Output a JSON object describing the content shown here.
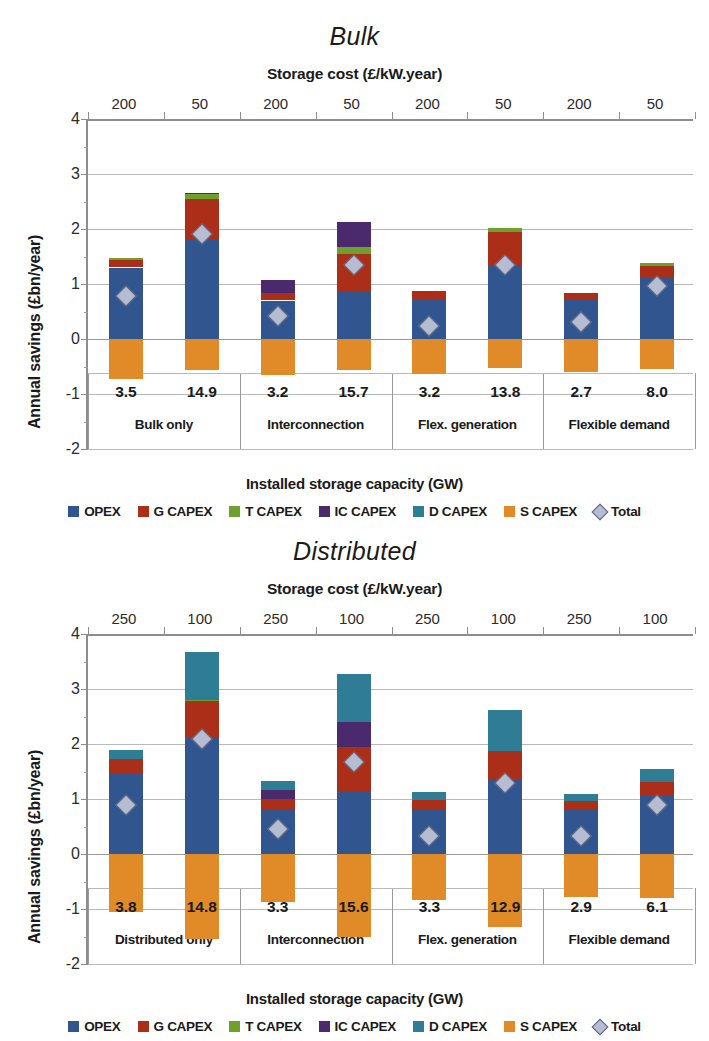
{
  "colors": {
    "opex": "#31558f",
    "g_capex": "#ab2f18",
    "t_capex": "#6ea02e",
    "ic_capex": "#4a2a6d",
    "d_capex": "#2e7d94",
    "s_capex": "#e18b28",
    "total_fill": "#b6bdd2",
    "total_edge": "#59607a",
    "grid": "#b9b9b9",
    "axis": "#8d8d8d"
  },
  "legend": {
    "items": [
      {
        "label": "OPEX",
        "key": "opex",
        "marker": "square"
      },
      {
        "label": "G CAPEX",
        "key": "g_capex",
        "marker": "square"
      },
      {
        "label": "T CAPEX",
        "key": "t_capex",
        "marker": "square"
      },
      {
        "label": "IC CAPEX",
        "key": "ic_capex",
        "marker": "square"
      },
      {
        "label": "D CAPEX",
        "key": "d_capex",
        "marker": "square"
      },
      {
        "label": "S CAPEX",
        "key": "s_capex",
        "marker": "square"
      },
      {
        "label": "Total",
        "key": "total_fill",
        "marker": "diamond"
      }
    ]
  },
  "charts": [
    {
      "id": "bulk",
      "title": "Bulk",
      "top_axis_title": "Storage cost (£/kW.year)",
      "bottom_axis_title": "Installed storage capacity (GW)",
      "ylabel": "Annual savings (£bn/year)",
      "yticks": [
        4,
        3,
        2,
        1,
        0,
        -1,
        -2
      ],
      "ylim": [
        -2,
        4
      ],
      "storage_costs": [
        "200",
        "50",
        "200",
        "50",
        "200",
        "50",
        "200",
        "50"
      ],
      "capacities": [
        "3.5",
        "14.9",
        "3.2",
        "15.7",
        "3.2",
        "13.8",
        "2.7",
        "8.0"
      ],
      "groups": [
        "Bulk only",
        "Interconnection",
        "Flex. generation",
        "Flexible demand"
      ],
      "series_order": [
        "s_capex",
        "opex",
        "g_capex",
        "t_capex",
        "ic_capex",
        "d_capex"
      ],
      "bars": [
        {
          "s_capex": -0.72,
          "opex": 1.3,
          "g_capex": 0.14,
          "t_capex": 0.04,
          "ic_capex": 0.0,
          "d_capex": 0.0,
          "total": 0.79
        },
        {
          "s_capex": -0.56,
          "opex": 1.8,
          "g_capex": 0.75,
          "t_capex": 0.08,
          "ic_capex": 0.03,
          "d_capex": 0.0,
          "total": 1.91
        },
        {
          "s_capex": -0.65,
          "opex": 0.7,
          "g_capex": 0.13,
          "t_capex": 0.0,
          "ic_capex": 0.25,
          "d_capex": 0.0,
          "total": 0.42
        },
        {
          "s_capex": -0.57,
          "opex": 0.87,
          "g_capex": 0.68,
          "t_capex": 0.13,
          "ic_capex": 0.44,
          "d_capex": 0.0,
          "total": 1.35
        },
        {
          "s_capex": -0.63,
          "opex": 0.71,
          "g_capex": 0.17,
          "t_capex": 0.0,
          "ic_capex": 0.0,
          "d_capex": 0.0,
          "total": 0.23
        },
        {
          "s_capex": -0.52,
          "opex": 1.33,
          "g_capex": 0.62,
          "t_capex": 0.07,
          "ic_capex": 0.0,
          "d_capex": 0.0,
          "total": 1.34
        },
        {
          "s_capex": -0.6,
          "opex": 0.72,
          "g_capex": 0.12,
          "t_capex": 0.0,
          "ic_capex": 0.0,
          "d_capex": 0.0,
          "total": 0.31
        },
        {
          "s_capex": -0.54,
          "opex": 1.12,
          "g_capex": 0.21,
          "t_capex": 0.05,
          "ic_capex": 0.0,
          "d_capex": 0.0,
          "total": 0.97
        }
      ]
    },
    {
      "id": "distributed",
      "title": "Distributed",
      "top_axis_title": "Storage cost (£/kW.year)",
      "bottom_axis_title": "Installed storage capacity (GW)",
      "ylabel": "Annual savings (£bn/year)",
      "yticks": [
        4,
        3,
        2,
        1,
        0,
        -1,
        -2
      ],
      "ylim": [
        -2,
        4
      ],
      "storage_costs": [
        "250",
        "100",
        "250",
        "100",
        "250",
        "100",
        "250",
        "100"
      ],
      "capacities": [
        "3.8",
        "14.8",
        "3.3",
        "15.6",
        "3.3",
        "12.9",
        "2.9",
        "6.1"
      ],
      "groups": [
        "Distributed only",
        "Interconnection",
        "Flex. generation",
        "Flexible demand"
      ],
      "series_order": [
        "s_capex",
        "opex",
        "g_capex",
        "t_capex",
        "ic_capex",
        "d_capex"
      ],
      "bars": [
        {
          "s_capex": -1.05,
          "opex": 1.45,
          "g_capex": 0.27,
          "t_capex": 0.0,
          "ic_capex": 0.0,
          "d_capex": 0.18,
          "total": 0.9
        },
        {
          "s_capex": -1.55,
          "opex": 2.13,
          "g_capex": 0.65,
          "t_capex": 0.02,
          "ic_capex": 0.0,
          "d_capex": 0.87,
          "total": 2.1
        },
        {
          "s_capex": -0.88,
          "opex": 0.82,
          "g_capex": 0.18,
          "t_capex": 0.0,
          "ic_capex": 0.16,
          "d_capex": 0.16,
          "total": 0.45
        },
        {
          "s_capex": -1.5,
          "opex": 1.15,
          "g_capex": 0.8,
          "t_capex": 0.0,
          "ic_capex": 0.45,
          "d_capex": 0.87,
          "total": 1.68
        },
        {
          "s_capex": -0.83,
          "opex": 0.8,
          "g_capex": 0.18,
          "t_capex": 0.0,
          "ic_capex": 0.0,
          "d_capex": 0.14,
          "total": 0.32
        },
        {
          "s_capex": -1.32,
          "opex": 1.37,
          "g_capex": 0.5,
          "t_capex": 0.0,
          "ic_capex": 0.0,
          "d_capex": 0.74,
          "total": 1.3
        },
        {
          "s_capex": -0.78,
          "opex": 0.8,
          "g_capex": 0.16,
          "t_capex": 0.0,
          "ic_capex": 0.0,
          "d_capex": 0.13,
          "total": 0.33
        },
        {
          "s_capex": -0.8,
          "opex": 1.05,
          "g_capex": 0.26,
          "t_capex": 0.0,
          "ic_capex": 0.0,
          "d_capex": 0.24,
          "total": 0.9
        }
      ]
    }
  ],
  "chart_data": [
    {
      "type": "bar",
      "stacked": true,
      "title": "Bulk",
      "xlabel": "Installed storage capacity (GW)",
      "ylabel": "Annual savings (£bn/year)",
      "ylim": [
        -2,
        4
      ],
      "yticks": [
        4,
        3,
        2,
        1,
        0,
        -1,
        -2
      ],
      "grid": true,
      "legend_position": "bottom",
      "secondary_xlabel": "Storage cost (£/kW.year)",
      "secondary_xtick_labels": [
        "200",
        "50",
        "200",
        "50",
        "200",
        "50",
        "200",
        "50"
      ],
      "categories": [
        "3.5",
        "14.9",
        "3.2",
        "15.7",
        "3.2",
        "13.8",
        "2.7",
        "8.0"
      ],
      "group_labels": [
        "Bulk only",
        "Interconnection",
        "Flex. generation",
        "Flexible demand"
      ],
      "series": [
        {
          "name": "OPEX",
          "values": [
            1.3,
            1.8,
            0.7,
            0.87,
            0.71,
            1.33,
            0.72,
            1.12
          ]
        },
        {
          "name": "G CAPEX",
          "values": [
            0.14,
            0.75,
            0.13,
            0.68,
            0.17,
            0.62,
            0.12,
            0.21
          ]
        },
        {
          "name": "T CAPEX",
          "values": [
            0.04,
            0.08,
            0.0,
            0.13,
            0.0,
            0.07,
            0.0,
            0.05
          ]
        },
        {
          "name": "IC CAPEX",
          "values": [
            0.0,
            0.03,
            0.25,
            0.44,
            0.0,
            0.0,
            0.0,
            0.0
          ]
        },
        {
          "name": "D CAPEX",
          "values": [
            0.0,
            0.0,
            0.0,
            0.0,
            0.0,
            0.0,
            0.0,
            0.0
          ]
        },
        {
          "name": "S CAPEX",
          "values": [
            -0.72,
            -0.56,
            -0.65,
            -0.57,
            -0.63,
            -0.52,
            -0.6,
            -0.54
          ]
        },
        {
          "name": "Total",
          "values": [
            0.79,
            1.91,
            0.42,
            1.35,
            0.23,
            1.34,
            0.31,
            0.97
          ],
          "marker": "diamond"
        }
      ]
    },
    {
      "type": "bar",
      "stacked": true,
      "title": "Distributed",
      "xlabel": "Installed storage capacity (GW)",
      "ylabel": "Annual savings (£bn/year)",
      "ylim": [
        -2,
        4
      ],
      "yticks": [
        4,
        3,
        2,
        1,
        0,
        -1,
        -2
      ],
      "grid": true,
      "legend_position": "bottom",
      "secondary_xlabel": "Storage cost (£/kW.year)",
      "secondary_xtick_labels": [
        "250",
        "100",
        "250",
        "100",
        "250",
        "100",
        "250",
        "100"
      ],
      "categories": [
        "3.8",
        "14.8",
        "3.3",
        "15.6",
        "3.3",
        "12.9",
        "2.9",
        "6.1"
      ],
      "group_labels": [
        "Distributed only",
        "Interconnection",
        "Flex. generation",
        "Flexible demand"
      ],
      "series": [
        {
          "name": "OPEX",
          "values": [
            1.45,
            2.13,
            0.82,
            1.15,
            0.8,
            1.37,
            0.8,
            1.05
          ]
        },
        {
          "name": "G CAPEX",
          "values": [
            0.27,
            0.65,
            0.18,
            0.8,
            0.18,
            0.5,
            0.16,
            0.26
          ]
        },
        {
          "name": "T CAPEX",
          "values": [
            0.0,
            0.02,
            0.0,
            0.0,
            0.0,
            0.0,
            0.0,
            0.0
          ]
        },
        {
          "name": "IC CAPEX",
          "values": [
            0.0,
            0.0,
            0.16,
            0.45,
            0.0,
            0.0,
            0.0,
            0.0
          ]
        },
        {
          "name": "D CAPEX",
          "values": [
            0.18,
            0.87,
            0.16,
            0.87,
            0.14,
            0.74,
            0.13,
            0.24
          ]
        },
        {
          "name": "S CAPEX",
          "values": [
            -1.05,
            -1.55,
            -0.88,
            -1.5,
            -0.83,
            -1.32,
            -0.78,
            -0.8
          ]
        },
        {
          "name": "Total",
          "values": [
            0.9,
            2.1,
            0.45,
            1.68,
            0.32,
            1.3,
            0.33,
            0.9
          ],
          "marker": "diamond"
        }
      ]
    }
  ]
}
